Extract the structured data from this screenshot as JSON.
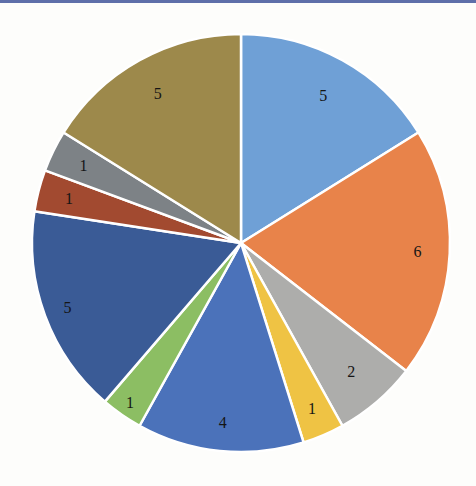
{
  "page": {
    "background": "#FDFDFB",
    "top_rule_color": "#5E6FA9"
  },
  "chart_data": {
    "type": "pie",
    "title": "",
    "legend": "none",
    "categories": [
      "slice-1",
      "slice-2",
      "slice-3",
      "slice-4",
      "slice-5",
      "slice-6",
      "slice-7",
      "slice-8",
      "slice-9",
      "slice-10"
    ],
    "values": [
      5,
      6,
      2,
      1,
      4,
      1,
      5,
      1,
      1,
      5
    ],
    "labels": [
      "5",
      "6",
      "2",
      "1",
      "4",
      "1",
      "5",
      "1",
      "1",
      "5"
    ],
    "total": 31,
    "colors": [
      "#6FA0D6",
      "#E8834A",
      "#ADADAB",
      "#EFC344",
      "#4B72BA",
      "#8CBE63",
      "#3A5B96",
      "#A24A30",
      "#7D8286",
      "#9D894B"
    ],
    "start_angle_deg": 0,
    "direction": "clockwise",
    "slice_border_color": "#FFFFFF",
    "slice_border_width": 2.5,
    "label_color": "#151515",
    "label_radius": [
      0.81,
      0.845,
      0.81,
      0.86,
      0.865,
      0.93,
      0.885,
      0.85,
      0.84,
      0.82
    ],
    "center": {
      "x": 241,
      "y": 243
    },
    "radius": 209
  }
}
